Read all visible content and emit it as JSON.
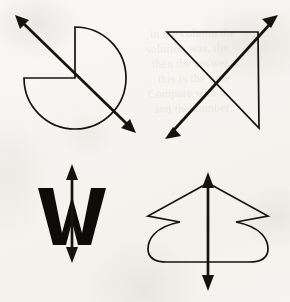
{
  "document": {
    "title": "Symmetry Figures Worksheet",
    "background_color": "#f7f5f2",
    "ink_color": "#16130f",
    "width": 290,
    "height": 302,
    "media": "scanned paper",
    "visible_text": []
  },
  "ghost_text": {
    "description": "faint show-through text from the reverse side of the page, illegible",
    "color": "#6d6255",
    "opacity": 0.085,
    "lines": [
      {
        "text": "in the column the",
        "x": 150,
        "y": 26
      },
      {
        "text": "solution was, the",
        "x": 146,
        "y": 41
      },
      {
        "text": "then the answer",
        "x": 152,
        "y": 56
      },
      {
        "text": "this is the time",
        "x": 158,
        "y": 71
      },
      {
        "text": "Compare with a",
        "x": 148,
        "y": 86
      },
      {
        "text": "and the number",
        "x": 154,
        "y": 101
      }
    ]
  },
  "figures": [
    {
      "id": "figure-1",
      "name": "three-quarter-circle-with-diagonal-axis",
      "quadrant": "top-left",
      "shape": {
        "type": "three-quarter circle (pac-man)",
        "center": [
          75,
          78
        ],
        "radius": 51,
        "missing_wedge": "upper-left quadrant",
        "arc_start_angle_deg": 270,
        "arc_sweep_deg": 270
      },
      "axis": {
        "type": "double-headed arrow",
        "orientation": "diagonal",
        "from": [
          16,
          16
        ],
        "to": [
          135,
          132
        ],
        "heads": "both"
      }
    },
    {
      "id": "figure-2",
      "name": "right-triangle-with-diagonal-axis",
      "quadrant": "top-right",
      "shape": {
        "type": "right triangle",
        "vertices": [
          [
            167,
            32
          ],
          [
            258,
            32
          ],
          [
            259,
            128
          ]
        ],
        "right_angle_at": [
          258,
          32
        ]
      },
      "axis": {
        "type": "double-headed arrow",
        "orientation": "diagonal",
        "from": [
          166,
          138
        ],
        "to": [
          277,
          16
        ],
        "heads": "both"
      }
    },
    {
      "id": "figure-3",
      "name": "letter-w-with-vertical-axis",
      "quadrant": "bottom-left",
      "shape": {
        "type": "letter glyph",
        "letter": "W",
        "weight": "bold",
        "center": [
          72,
          214
        ]
      },
      "axis": {
        "type": "double-headed arrow",
        "orientation": "vertical",
        "from": [
          72,
          165
        ],
        "to": [
          72,
          262
        ],
        "heads": "both"
      }
    },
    {
      "id": "figure-4",
      "name": "vase-shape-with-vertical-axis",
      "quadrant": "bottom-right",
      "shape": {
        "type": "symmetric vase / arrow outline",
        "apex": [
          208,
          183
        ],
        "left_extent": 133,
        "right_extent": 268,
        "bottom": 262,
        "features": [
          "pointed apex",
          "angled shoulders",
          "inward notches",
          "bulging rounded sides",
          "flat bottom with rounded corners"
        ]
      },
      "axis": {
        "type": "double-headed arrow",
        "orientation": "vertical",
        "from": [
          208,
          173
        ],
        "to": [
          208,
          290
        ],
        "heads": "both"
      }
    }
  ]
}
